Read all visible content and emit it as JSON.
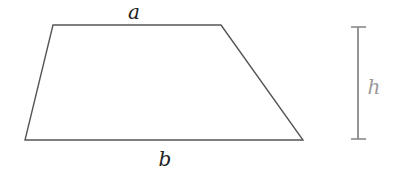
{
  "shape": {
    "type": "trapezoid",
    "vertices": {
      "top_left": [
        53,
        25
      ],
      "top_right": [
        221,
        25
      ],
      "bottom_right": [
        303,
        140
      ],
      "bottom_left": [
        25,
        140
      ]
    },
    "stroke_color": "#555555"
  },
  "labels": {
    "top_base": "a",
    "bottom_base": "b",
    "height": "h"
  },
  "height_marker": {
    "x": 358,
    "y_top": 27,
    "y_bottom": 139,
    "cap_half_width": 7,
    "color": "#8a8a8a",
    "label_color": "#9a9a9a"
  }
}
